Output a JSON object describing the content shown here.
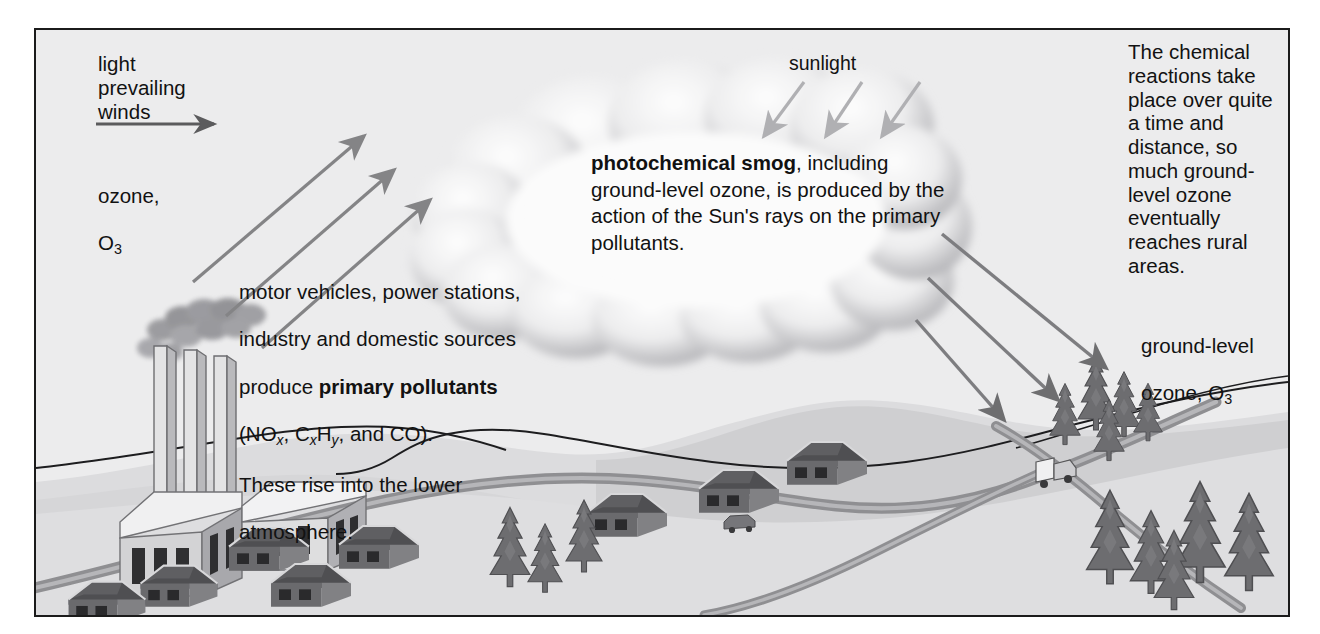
{
  "diagram": {
    "frame": {
      "border_color": "#1b1b1b",
      "background_color": "#ececed"
    }
  },
  "labels": {
    "prevailing_winds": "light\nprevailing\nwinds",
    "ozone_line1": "ozone,",
    "ozone_symbol_base": "O",
    "ozone_symbol_sub": "3",
    "sunlight": "sunlight",
    "ground_level_ozone_line1": "ground-level",
    "ground_level_ozone_line2": "ozone, O",
    "ground_level_ozone_sub": "3",
    "right_block": "The chemical\nreactions take\nplace over quite\na time and\ndistance, so\nmuch ground-\nlevel ozone\neventually\nreaches rural\nareas."
  },
  "sources_text": {
    "line1": "motor vehicles, power stations,",
    "line2": "industry and domestic sources",
    "line3_pre": "produce ",
    "line3_bold": "primary pollutants",
    "line4_a": "(NO",
    "line4_sub_a": "x",
    "line4_b": ", C",
    "line4_sub_b": "x",
    "line4_c": "H",
    "line4_sub_c": "y",
    "line4_d": ", and CO).",
    "line5": "These rise into the lower",
    "line6": "atmosphere."
  },
  "cloud_text": {
    "bold": "photochemical smog",
    "rest": ", including ground-level ozone, is produced by the action of the Sun's rays on the primary pollutants."
  },
  "colors": {
    "ink": "#121212",
    "sky": "#ececed",
    "far_hills": "#d8d8d9",
    "mid_hills": "#cfcfd0",
    "ground": "#dcdcdd",
    "road": "#9a9a9c",
    "arrow_gray": "#848486",
    "sun_arrow_gray": "#aeaeb0",
    "tree_dark": "#6d6d70",
    "roof_dark": "#5c5c5f",
    "building_light": "#e6e6e7",
    "smoke_gray": "#97979a",
    "cloud_edge": "#a9a9ac"
  },
  "arrows": {
    "wind_horizontal": 1,
    "rising_pollutant_arrows": 3,
    "sunlight_arrows": 3,
    "descending_ozone_arrows": 3
  },
  "scene_objects": {
    "smokestacks": 3,
    "factory_buildings": 2,
    "houses": 8,
    "car": 1,
    "truck": 1,
    "mid_trees": 3,
    "hill_trees": 5,
    "foreground_trees": 5
  }
}
